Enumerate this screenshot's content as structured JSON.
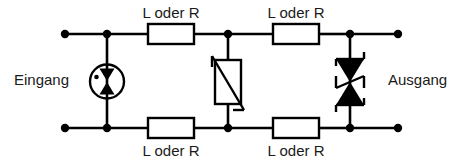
{
  "diagram": {
    "language": "de",
    "background_color": "#ffffff",
    "line_color": "#000000",
    "text_color": "#1a1a1a"
  },
  "labels": {
    "input": "Eingang",
    "output": "Ausgang",
    "series_top_left": "L oder R",
    "series_top_right": "L oder R",
    "series_bottom_left": "L oder R",
    "series_bottom_right": "L oder R"
  },
  "components": [
    {
      "id": "gas-discharge-tube",
      "name": "gas-discharge-tube",
      "type": "spark-gap",
      "label": "",
      "stage": "input",
      "orientation": "vertical"
    },
    {
      "id": "varistor",
      "name": "varistor",
      "type": "voltage-dependent-resistor",
      "label": "",
      "stage": "middle",
      "orientation": "vertical"
    },
    {
      "id": "tvs-diode",
      "name": "bidirectional-tvs-diode",
      "type": "suppressor-diode",
      "label": "",
      "stage": "output",
      "orientation": "vertical"
    },
    {
      "id": "series-top-left",
      "name": "series-element-top-left",
      "type": "inductor-or-resistor",
      "label": "L oder R",
      "rail": "top"
    },
    {
      "id": "series-top-right",
      "name": "series-element-top-right",
      "type": "inductor-or-resistor",
      "label": "L oder R",
      "rail": "top"
    },
    {
      "id": "series-bottom-left",
      "name": "series-element-bottom-left",
      "type": "inductor-or-resistor",
      "label": "L oder R",
      "rail": "bottom"
    },
    {
      "id": "series-bottom-right",
      "name": "series-element-bottom-right",
      "type": "inductor-or-resistor",
      "label": "L oder R",
      "rail": "bottom"
    }
  ],
  "terminals": [
    {
      "name": "input-terminal-top",
      "rail": "top",
      "side": "left"
    },
    {
      "name": "input-terminal-bottom",
      "rail": "bottom",
      "side": "left"
    },
    {
      "name": "output-terminal-top",
      "rail": "top",
      "side": "right"
    },
    {
      "name": "output-terminal-bottom",
      "rail": "bottom",
      "side": "right"
    }
  ],
  "nodes": [
    {
      "name": "node-gdt-top",
      "rail": "top"
    },
    {
      "name": "node-gdt-bottom",
      "rail": "bottom"
    },
    {
      "name": "node-varistor-top",
      "rail": "top"
    },
    {
      "name": "node-varistor-bottom",
      "rail": "bottom"
    },
    {
      "name": "node-tvs-top",
      "rail": "top"
    },
    {
      "name": "node-tvs-bottom",
      "rail": "bottom"
    }
  ]
}
